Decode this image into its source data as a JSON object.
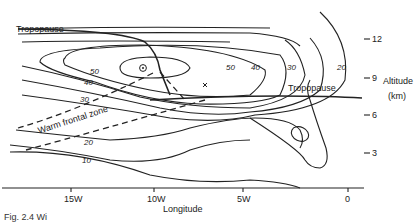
{
  "figure": {
    "caption": "Fig. 2.4  Wi",
    "labels": {
      "tropopause_left": "Tropopause",
      "tropopause_right": "Tropopause",
      "warm_frontal_zone": "Warm frontal zone",
      "x_axis_title": "Longitude",
      "y_axis_title_line1": "Altitude",
      "y_axis_title_line2": "(km)"
    },
    "x_ticks": [
      "15W",
      "10W",
      "5W",
      "0"
    ],
    "y_ticks": [
      "12",
      "9",
      "6",
      "3"
    ],
    "isotach_labels_left": [
      "50",
      "40",
      "30",
      "20",
      "10"
    ],
    "isotach_labels_right": [
      "50",
      "40",
      "30",
      "20"
    ],
    "jet_core_marker": "⊗",
    "cross_marker": "×"
  }
}
